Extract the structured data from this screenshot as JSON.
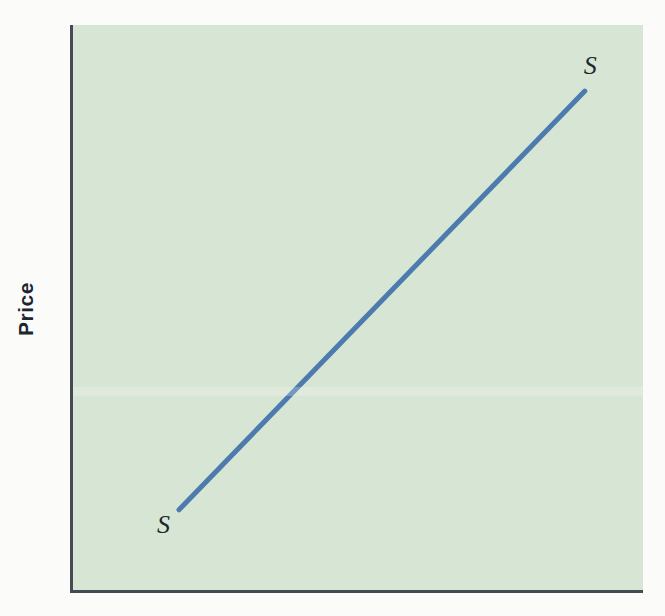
{
  "figure": {
    "background": "#fbfcfa"
  },
  "chart_data": {
    "type": "line",
    "title": "",
    "xlabel": "",
    "ylabel": "Price",
    "grid": false,
    "tick_labels": "none",
    "plot_background": "#d7e5d4",
    "axis_color": "#454b55",
    "axes_shown": [
      "left",
      "bottom"
    ],
    "series": [
      {
        "name": "supply-curve",
        "start_label": "S",
        "end_label": "S",
        "color": "#4d7bae",
        "stroke_width": 5,
        "points_norm": [
          {
            "x": 0.186,
            "y": 0.142
          },
          {
            "x": 0.898,
            "y": 0.883
          }
        ]
      }
    ]
  }
}
